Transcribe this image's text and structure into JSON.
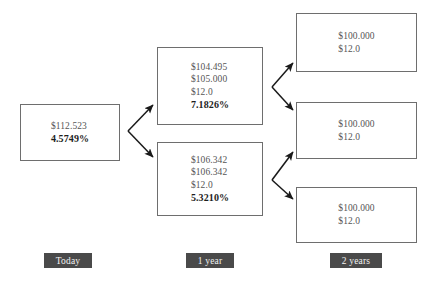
{
  "diagram": {
    "background_color": "#ffffff",
    "box_border_color": "#6e6e6e",
    "value_text_color": "#555555",
    "rate_text_color": "#1d1d1d",
    "arrow_color": "#1a1a1a",
    "label_background_color": "#4a4a4a",
    "label_text_color": "#f2f2f2"
  },
  "nodes": {
    "today": {
      "name": "today-node",
      "lines": [
        "$112.523",
        "4.5749%"
      ],
      "price": "$112.523",
      "rate": "4.5749%"
    },
    "year1_up": {
      "name": "year1-upper-node",
      "lines": [
        "$104.495",
        "$105.000",
        "$12.0",
        "7.1826%"
      ],
      "value": "$104.495",
      "value_plus_coupon": "$105.000",
      "coupon": "$12.0",
      "rate": "7.1826%"
    },
    "year1_down": {
      "name": "year1-lower-node",
      "lines": [
        "$106.342",
        "$106.342",
        "$12.0",
        "5.3210%"
      ],
      "value": "$106.342",
      "value_plus_coupon": "$106.342",
      "coupon": "$12.0",
      "rate": "5.3210%"
    },
    "year2_up": {
      "name": "year2-upper-node",
      "lines": [
        "$100.000",
        "$12.0"
      ],
      "value": "$100.000",
      "coupon": "$12.0"
    },
    "year2_mid": {
      "name": "year2-middle-node",
      "lines": [
        "$100.000",
        "$12.0"
      ],
      "value": "$100.000",
      "coupon": "$12.0"
    },
    "year2_down": {
      "name": "year2-lower-node",
      "lines": [
        "$100.000",
        "$12.0"
      ],
      "value": "$100.000",
      "coupon": "$12.0"
    }
  },
  "period_labels": [
    {
      "id": "today",
      "text": "Today"
    },
    {
      "id": "year1",
      "text": "1 year"
    },
    {
      "id": "year2",
      "text": "2 years"
    }
  ]
}
